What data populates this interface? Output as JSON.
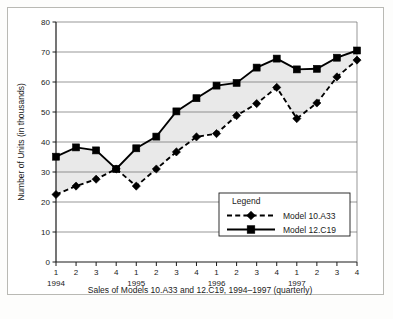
{
  "figure": {
    "caption": "Sales of Models 10.A33 and 12.C19, 1994–1997 (quarterly)",
    "y_axis_title": "Number of Units (in thousands)",
    "legend_title": "Legend"
  },
  "chart_data": {
    "type": "line",
    "title": "",
    "subtitle": "",
    "caption": "Sales of Models 10.A33 and 12.C19, 1994–1997 (quarterly)",
    "xlabel": "",
    "ylabel": "Number of Units (in thousands)",
    "ylim": [
      0,
      80
    ],
    "y_ticks": [
      0,
      10,
      20,
      30,
      40,
      50,
      60,
      70,
      80
    ],
    "y_tick_labels": [
      "0",
      "10",
      "20",
      "30",
      "40",
      "50",
      "60",
      "70",
      "80"
    ],
    "grid": true,
    "grid_axis": "y",
    "legend_position": "inside-lower-right",
    "legend_title": "Legend",
    "x_tick_labels": [
      "1",
      "2",
      "3",
      "4",
      "1",
      "2",
      "3",
      "4",
      "1",
      "2",
      "3",
      "4",
      "1",
      "2",
      "3",
      "4"
    ],
    "x_group_labels": [
      "1994",
      "1995",
      "1996",
      "1997"
    ],
    "categories": [
      "1994 Q1",
      "1994 Q2",
      "1994 Q3",
      "1994 Q4",
      "1995 Q1",
      "1995 Q2",
      "1995 Q3",
      "1995 Q4",
      "1996 Q1",
      "1996 Q2",
      "1996 Q3",
      "1996 Q4",
      "1997 Q1",
      "1997 Q2",
      "1997 Q3",
      "1997 Q4"
    ],
    "series": [
      {
        "name": "Model 10.A33",
        "marker": "diamond",
        "line_style": "dashed",
        "color": "#000000",
        "values": [
          22.5,
          25.3,
          27.6,
          31.0,
          25.3,
          31.0,
          36.7,
          41.7,
          42.8,
          48.8,
          52.8,
          58.2,
          47.8,
          53.0,
          61.7,
          67.3
        ]
      },
      {
        "name": "Model 12.C19",
        "marker": "square",
        "line_style": "solid",
        "color": "#000000",
        "values": [
          35.1,
          38.2,
          37.2,
          31.0,
          37.9,
          41.8,
          50.2,
          54.6,
          58.8,
          59.7,
          64.8,
          67.8,
          64.2,
          64.4,
          68.1,
          70.5
        ]
      }
    ],
    "band_fill": "#e9e9e9"
  }
}
